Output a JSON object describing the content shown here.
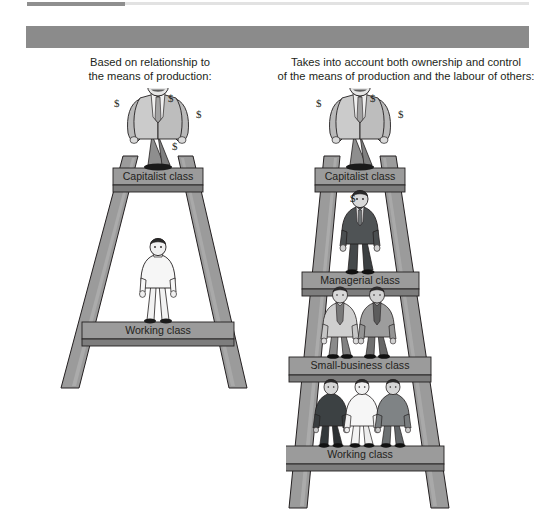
{
  "figure": {
    "name": "class-models-ladder-diagram",
    "columns": [
      {
        "id": "marx",
        "header": "Marx's Model",
        "subtitle": "Based on relationship to\nthe means of production:",
        "subtitle_line1": "Based on relationship to",
        "subtitle_line2": "the means of production:",
        "rungs": [
          {
            "label": "Capitalist class",
            "figures": 1,
            "figure_type": "capitalist",
            "dollars": 4
          },
          {
            "label": "Working class",
            "figures": 1,
            "figure_type": "worker-light",
            "dollars": 0
          }
        ]
      },
      {
        "id": "wright",
        "header": "Wright's Model",
        "subtitle": "Takes into account both ownership and control\nof the means of production and the labour of others:",
        "subtitle_line1": "Takes into account both ownership and control",
        "subtitle_line2": "of the means of production and the labour of others:",
        "rungs": [
          {
            "label": "Capitalist class",
            "figures": 1,
            "figure_type": "capitalist",
            "dollars": 3
          },
          {
            "label": "Managerial class",
            "figures": 1,
            "figure_type": "manager-dark",
            "dollars": 1
          },
          {
            "label": "Small-business class",
            "figures": 2,
            "figure_type": "small-business",
            "dollars": 0
          },
          {
            "label": "Working class",
            "figures": 3,
            "figure_type": "worker-mixed",
            "dollars": 0
          }
        ]
      }
    ],
    "dollar_symbol": "$",
    "colors": {
      "header_bar": "#8b8b8b",
      "header_text": "#ffffff",
      "rung_face": "#9b9b9b",
      "rung_edge": "#7b7b7b",
      "rail": "#9b9b9b",
      "rail_shade": "#8a8a8a",
      "outline": "#231f20",
      "body_text": "#231f20",
      "top_rule_dark": "#8f8f8f",
      "top_rule_light": "#e2e2e2",
      "suit_light": "#c9c9c9",
      "suit_dark": "#4f5355",
      "suit_mid": "#8c8c8c",
      "skin": "#e9e9e9",
      "page_background": "#ffffff"
    }
  }
}
